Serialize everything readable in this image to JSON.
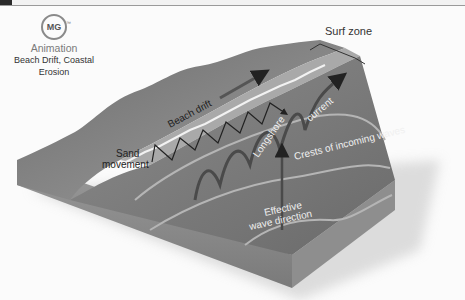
{
  "badge": {
    "logo_text": "MG",
    "trademark": "™",
    "kind": "Animation",
    "title_line1": "Beach Drift, Coastal",
    "title_line2": "Erosion"
  },
  "diagram": {
    "labels": {
      "surf_zone": "Surf zone",
      "beach_drift": "Beach drift",
      "sand_line1": "Sand",
      "sand_line2": "movement",
      "longshore": "Longshore",
      "current": "current",
      "crests": "Crests of incoming waves",
      "effective_line1": "Effective",
      "effective_line2": "wave direction"
    }
  }
}
